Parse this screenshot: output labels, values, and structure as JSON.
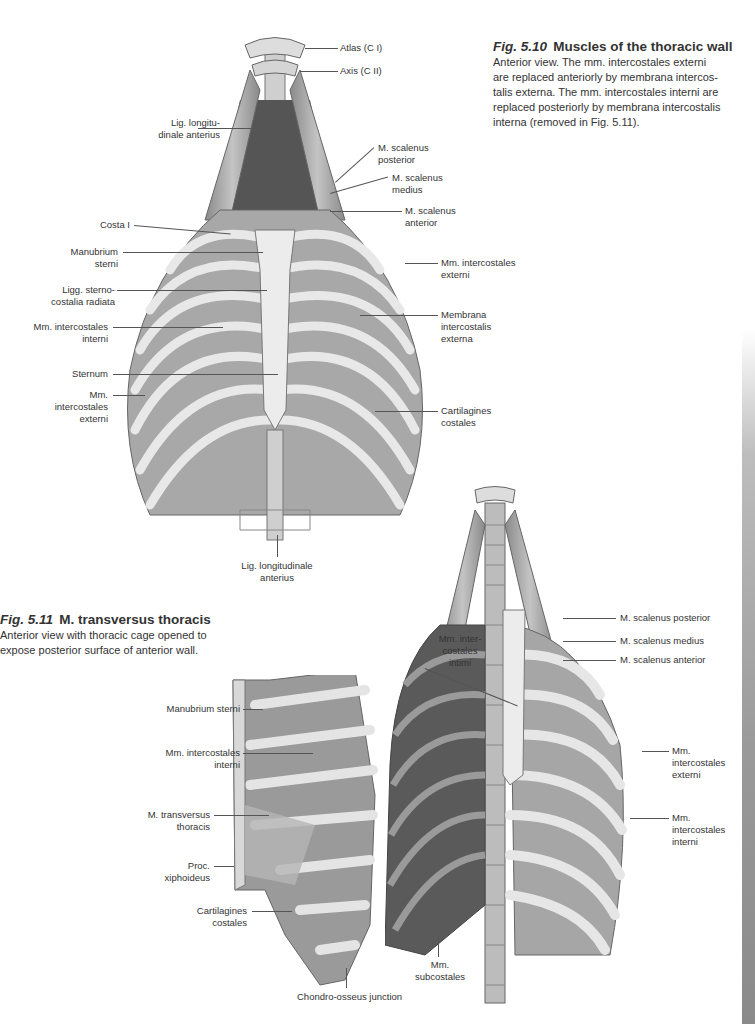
{
  "figure_5_10": {
    "number": "Fig. 5.10",
    "title": "Muscles of the thoracic wall",
    "caption": "Anterior view. The mm. intercostales externi are replaced anteriorly by membrana intercos-talis externa. The mm. intercostales interni are replaced posteriorly by membrana intercostalis interna (removed in Fig. 5.11).",
    "caption_lines": [
      "Anterior view. The mm. intercostales externi",
      "are replaced anteriorly by membrana intercos-",
      "talis externa. The mm. intercostales interni are",
      "replaced posteriorly by membrana intercostalis",
      "interna (removed in Fig. 5.11)."
    ],
    "labels": {
      "atlas": "Atlas (C I)",
      "axis": "Axis (C II)",
      "lig_longitu_1": "Lig. longitu-",
      "lig_longitu_2": "dinale anterius",
      "scalenus_post_1": "M. scalenus",
      "scalenus_post_2": "posterior",
      "scalenus_med_1": "M. scalenus",
      "scalenus_med_2": "medius",
      "scalenus_ant_1": "M. scalenus",
      "scalenus_ant_2": "anterior",
      "costa_i": "Costa I",
      "manubrium_1": "Manubrium",
      "manubrium_2": "sterni",
      "ligg_sterno_1": "Ligg. sterno-",
      "ligg_sterno_2": "costalia radiata",
      "intercost_int_1": "Mm. intercostales",
      "intercost_int_2": "interni",
      "sternum": "Sternum",
      "intercost_ext_l_1": "Mm.",
      "intercost_ext_l_2": "intercostales",
      "intercost_ext_l_3": "externi",
      "intercost_ext_r_1": "Mm. intercostales",
      "intercost_ext_r_2": "externi",
      "membrana_1": "Membrana",
      "membrana_2": "intercostalis",
      "membrana_3": "externa",
      "cartilagines_1": "Cartilagines",
      "cartilagines_2": "costales",
      "lig_longitudinale_1": "Lig. longitudinale",
      "lig_longitudinale_2": "anterius"
    }
  },
  "figure_5_11": {
    "number": "Fig. 5.11",
    "title": "M. transversus thoracis",
    "caption_lines": [
      "Anterior view with thoracic cage opened to",
      "expose posterior surface of anterior wall."
    ],
    "labels": {
      "manubrium": "Manubrium sterni",
      "intercost_int_1": "Mm. intercostales",
      "intercost_int_2": "interni",
      "transversus_1": "M. transversus",
      "transversus_2": "thoracis",
      "xiphoideus_1": "Proc.",
      "xiphoideus_2": "xiphoideus",
      "cartilagines_1": "Cartilagines",
      "cartilagines_2": "costales",
      "chondro": "Chondro-osseus junction",
      "intimi_1": "Mm. inter-",
      "intimi_2": "costales",
      "intimi_3": "intimi",
      "subcostales_1": "Mm.",
      "subcostales_2": "subcostales",
      "scalenus_post": "M. scalenus posterior",
      "scalenus_med": "M. scalenus medius",
      "scalenus_ant": "M. scalenus anterior",
      "intercost_ext_1": "Mm.",
      "intercost_ext_2": "intercostales",
      "intercost_ext_3": "externi",
      "intercost_int_r_1": "Mm.",
      "intercost_int_r_2": "intercostales",
      "intercost_int_r_3": "interni"
    }
  },
  "colors": {
    "text": "#333333",
    "bone": "#e6e6e6",
    "muscle": "#9c9c9c",
    "dark": "#3a3a3a"
  }
}
